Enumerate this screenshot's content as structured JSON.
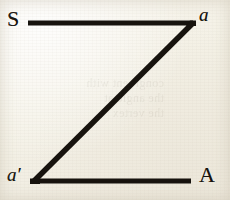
{
  "figure": {
    "background_color": "#f6f3ea",
    "ink_color": "#17130e",
    "bleed_through_text": "congruent with\nthe angle at\nthe vertex",
    "labels": {
      "top_left": "S",
      "top_right": "a",
      "bottom_left": "a′",
      "bottom_right": "A"
    }
  },
  "chart_data": {
    "type": "line",
    "title": "",
    "xlabel": "",
    "ylabel": "",
    "xlim": [
      0,
      230
    ],
    "ylim": [
      0,
      200
    ],
    "grid": false,
    "legend": null,
    "series": [
      {
        "name": "top-segment",
        "points": [
          [
            28,
            23
          ],
          [
            193,
            23
          ]
        ],
        "stroke_width": 5
      },
      {
        "name": "diagonal-segment",
        "points": [
          [
            193,
            23
          ],
          [
            34,
            181
          ]
        ],
        "stroke_width": 5.5
      },
      {
        "name": "bottom-segment",
        "points": [
          [
            34,
            181
          ],
          [
            191,
            181
          ]
        ],
        "stroke_width": 5
      }
    ],
    "annotations": [
      {
        "text": "S",
        "x": 14,
        "y": 19,
        "style": "upright-serif-capital"
      },
      {
        "text": "a",
        "x": 206,
        "y": 15,
        "style": "italic-serif-lowercase"
      },
      {
        "text": "a′",
        "x": 16,
        "y": 175,
        "style": "italic-serif-lowercase-prime"
      },
      {
        "text": "A",
        "x": 209,
        "y": 175,
        "style": "upright-serif-capital"
      }
    ]
  }
}
